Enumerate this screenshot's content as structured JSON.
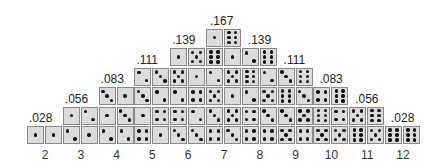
{
  "sums": [
    "2",
    "3",
    "4",
    "5",
    "6",
    "7",
    "8",
    "9",
    "10",
    "11",
    "12"
  ],
  "probabilities": [
    ".028",
    ".056",
    ".083",
    ".111",
    ".139",
    ".167",
    ".139",
    ".111",
    ".083",
    ".056",
    ".028"
  ],
  "rows": [
    [
      1,
      6
    ],
    [
      1,
      5,
      6,
      1,
      2,
      6
    ],
    [
      2,
      3,
      5,
      1,
      2,
      5,
      6,
      2,
      3,
      6
    ],
    [
      3,
      1,
      3,
      2,
      2,
      4,
      5,
      1,
      2,
      5,
      6,
      3,
      4,
      6
    ],
    [
      1,
      2,
      1,
      3,
      1,
      4,
      4,
      2,
      3,
      5,
      4,
      3,
      3,
      5,
      6,
      4,
      5,
      6
    ],
    [
      1,
      1,
      2,
      1,
      2,
      2,
      4,
      1,
      3,
      3,
      4,
      3,
      4,
      4,
      5,
      4,
      5,
      5,
      6,
      5,
      6,
      6
    ]
  ],
  "colors": {
    "die_face": "#dcdcdc",
    "pip": "#111111",
    "border": "#8a8a8a"
  }
}
